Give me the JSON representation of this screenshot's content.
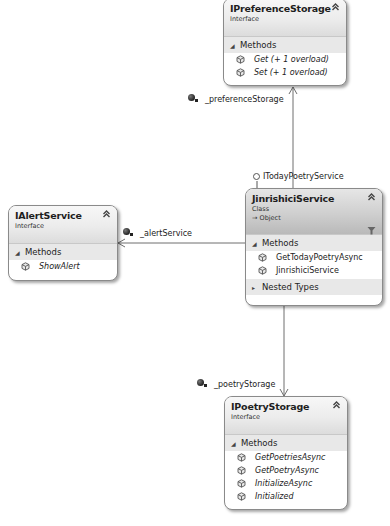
{
  "diagram": {
    "shapes": {
      "preference_storage": {
        "name": "IPreferenceStorage",
        "kind": "Interface",
        "collapse_icon": "double-chevron-up-icon",
        "sections": [
          {
            "label": "Methods",
            "expanded": true,
            "members": [
              {
                "name": "Get (+ 1 overload)",
                "icon": "method-icon",
                "italic": true
              },
              {
                "name": "Set (+ 1 overload)",
                "icon": "method-icon",
                "italic": true
              }
            ]
          }
        ]
      },
      "jinrishici_service": {
        "name": "JinrishiciService",
        "kind": "Class",
        "base": "→ Object",
        "collapse_icon": "double-chevron-up-icon",
        "filter_icon": "filter-icon",
        "sections": [
          {
            "label": "Methods",
            "expanded": true,
            "members": [
              {
                "name": "GetTodayPoetryAsync",
                "icon": "method-icon",
                "italic": false
              },
              {
                "name": "JinrishiciService",
                "icon": "method-icon",
                "italic": false
              }
            ]
          },
          {
            "label": "Nested Types",
            "expanded": false,
            "members": []
          }
        ]
      },
      "alert_service": {
        "name": "IAlertService",
        "kind": "Interface",
        "collapse_icon": "double-chevron-up-icon",
        "sections": [
          {
            "label": "Methods",
            "expanded": true,
            "members": [
              {
                "name": "ShowAlert",
                "icon": "method-icon",
                "italic": true
              }
            ]
          }
        ]
      },
      "poetry_storage": {
        "name": "IPoetryStorage",
        "kind": "Interface",
        "collapse_icon": "double-chevron-up-icon",
        "sections": [
          {
            "label": "Methods",
            "expanded": true,
            "members": [
              {
                "name": "GetPoetriesAsync",
                "icon": "method-icon",
                "italic": true
              },
              {
                "name": "GetPoetryAsync",
                "icon": "method-icon",
                "italic": true
              },
              {
                "name": "InitializeAsync",
                "icon": "method-icon",
                "italic": true
              },
              {
                "name": "Initialized",
                "icon": "method-icon",
                "italic": true
              }
            ]
          }
        ]
      }
    },
    "associations": {
      "preference_storage": {
        "label": "_preferenceStorage",
        "icon": "field-icon"
      },
      "alert_service": {
        "label": "_alertService",
        "icon": "field-icon"
      },
      "poetry_storage": {
        "label": "_poetryStorage",
        "icon": "field-icon"
      }
    },
    "lollipop": {
      "label": "ITodayPoetryService",
      "icon": "interface-lollipop-icon"
    },
    "colors": {
      "line": "#6e6e6e",
      "border": "#8a8a8a",
      "section_bg": "#e8e8e8",
      "class_header_dark": "#b9b9b9",
      "interface_header_light": "#f7f7f7"
    }
  }
}
